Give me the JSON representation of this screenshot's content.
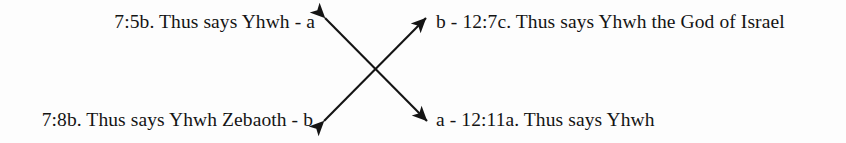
{
  "figure": {
    "type": "chiasm-diagram",
    "background_color": "#fdfdfd",
    "ink_color": "#141414",
    "labels": {
      "top_left": "7:5b. Thus says Yhwh - a",
      "top_right": "b - 12:7c. Thus says Yhwh the God of Israel",
      "bottom_left": "7:8b. Thus says Yhwh Zebaoth - b",
      "bottom_right": "a - 12:11a. Thus says Yhwh"
    },
    "connectors": [
      {
        "name": "arrow-top-left-to-bottom-right",
        "links": "a",
        "from": "top_left",
        "to": "bottom_right",
        "double_headed": true
      },
      {
        "name": "arrow-bottom-left-to-top-right",
        "links": "b",
        "from": "bottom_left",
        "to": "top_right",
        "double_headed": true
      }
    ]
  }
}
